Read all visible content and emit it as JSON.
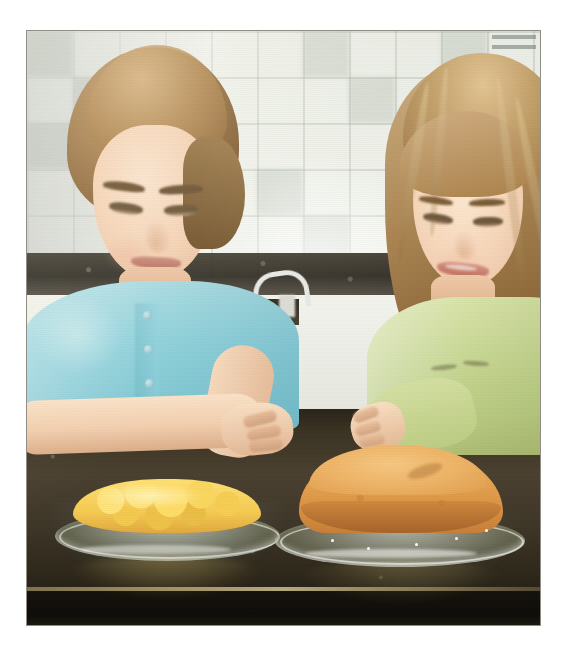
{
  "photo": {
    "title": "Two girls looking at two homemade cakes on a kitchen counter",
    "frame": {
      "background_color": "#ffffff",
      "border_color": "#8e8e86",
      "left": 27,
      "top": 31,
      "width": 513,
      "height": 594
    },
    "scene": {
      "setting": "kitchen",
      "wall_description": "white ceramic square tile backsplash",
      "wall_color": "#eef1ea",
      "tile_grout_color": "#96a096",
      "counter_description": "dark speckled granite countertop",
      "counter_color": "#3d3527",
      "counter_edge_color": "#0e0c08",
      "background_fixture": "kitchen-faucet"
    },
    "subjects": [
      {
        "id": "girl-left",
        "position": "left",
        "description": "girl with wavy light-brown hair pulled back, looking down and smiling",
        "shirt_label": "light blue button placket top",
        "shirt_color": "#8fd2dc",
        "hair_color": "#a98250",
        "skin_color": "#f6d4b7",
        "pose": "arms crossed resting on counter"
      },
      {
        "id": "girl-right",
        "position": "right",
        "description": "girl with long straight blonde-brown hair, looking down and smiling",
        "shirt_label": "pale green long-sleeve top with embroidery",
        "shirt_color": "#c9d894",
        "hair_color": "#ab8551",
        "skin_color": "#f7d7ba",
        "pose": "leaning on counter, hand near cake"
      }
    ],
    "objects": [
      {
        "id": "dish-left",
        "name": "fruit-topped dessert",
        "description": "clear glass pie plate holding a yellow mango / peach topped dessert",
        "food_color": "#f6cb52",
        "plate_material": "clear glass"
      },
      {
        "id": "dish-right",
        "name": "sponge cake",
        "description": "golden brown round sponge cake on a clear glass plate",
        "food_color": "#e8a855",
        "plate_material": "clear glass"
      }
    ],
    "corner_mark": {
      "name": "corner-watermark",
      "lines": 2,
      "color": "#6e7670"
    }
  }
}
